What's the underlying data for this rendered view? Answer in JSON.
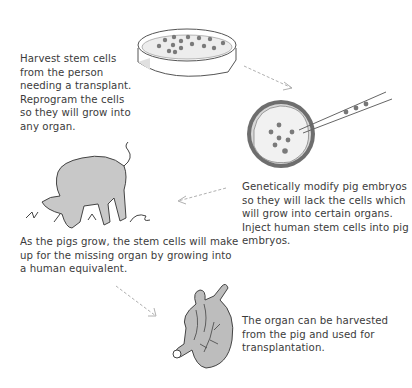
{
  "steps": [
    {
      "id": "harvest",
      "text": "Harvest stem cells from the person needing a transplant. Reprogram the cells so they will grow into any organ.",
      "illustration": "petri-dish-icon"
    },
    {
      "id": "modify",
      "text": "Genetically modify pig embryos so they will lack the cells which will grow into certain organs. Inject human stem cells into pig embryos.",
      "illustration": "embryo-injection-icon"
    },
    {
      "id": "grow",
      "text": "As the pigs grow, the stem cells will make up for the missing organ by growing into a human equivalent.",
      "illustration": "pig-icon"
    },
    {
      "id": "transplant",
      "text": "The organ can be harvested from the pig and used for transplantation.",
      "illustration": "heart-organ-icon"
    }
  ],
  "colors": {
    "illustration_fill": "#c8c8c8",
    "outline": "#555555",
    "cell": "#777777",
    "arrow": "#b0b0b0",
    "text": "#3b3b3b"
  }
}
